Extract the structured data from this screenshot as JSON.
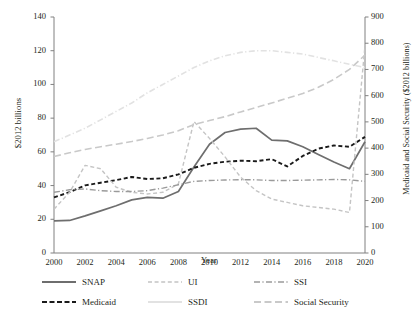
{
  "chart_data": {
    "type": "line",
    "title": "",
    "xlabel": "Year",
    "ylabel": "$2012 billions",
    "y2label": "Medicaid and Social Security ($2012 billions)",
    "xlim": [
      2000,
      2020
    ],
    "ylim": [
      0,
      140
    ],
    "y2lim": [
      0,
      900
    ],
    "grid": false,
    "legend_position": "bottom",
    "x": [
      2000,
      2001,
      2002,
      2003,
      2004,
      2005,
      2006,
      2007,
      2008,
      2009,
      2010,
      2011,
      2012,
      2013,
      2014,
      2015,
      2016,
      2017,
      2018,
      2019,
      2020
    ],
    "xticks": [
      "2000",
      "2002",
      "2004",
      "2006",
      "2008",
      "2010",
      "2012",
      "2014",
      "2016",
      "2018",
      "2020"
    ],
    "yticks": [
      "0",
      "20",
      "40",
      "60",
      "80",
      "100",
      "120",
      "140"
    ],
    "y2ticks": [
      "0",
      "100",
      "200",
      "300",
      "400",
      "500",
      "600",
      "700",
      "800",
      "900"
    ],
    "series": [
      {
        "name": "SNAP",
        "axis": "left",
        "color": "#6e6e6e",
        "style": "solid",
        "width": 1.7,
        "values": [
          19,
          19.3,
          22,
          25,
          28,
          31.5,
          33,
          32.5,
          36.5,
          51,
          64.5,
          71.5,
          73.5,
          74,
          67,
          66.5,
          63,
          58.5,
          54,
          50,
          66
        ]
      },
      {
        "name": "Medicaid",
        "axis": "right",
        "color": "#1a1a1a",
        "style": "dashed",
        "width": 1.9,
        "values": [
          212,
          232,
          258,
          268,
          278,
          290,
          282,
          285,
          300,
          325,
          340,
          348,
          352,
          350,
          358,
          330,
          370,
          398,
          410,
          405,
          443
        ]
      },
      {
        "name": "UI",
        "axis": "left",
        "color": "#c4c4c4",
        "style": "dashed",
        "width": 1.4,
        "values": [
          26,
          36,
          52,
          50,
          39,
          36,
          35,
          36,
          41,
          78,
          68,
          57,
          45,
          37,
          32,
          30,
          28,
          27,
          26,
          24,
          123
        ]
      },
      {
        "name": "SSDI",
        "axis": "left",
        "color": "#e2e2e2",
        "style": "dashdot",
        "width": 1.6,
        "values": [
          66,
          70,
          74,
          79,
          84,
          89,
          95,
          100,
          105,
          110,
          114,
          117,
          119,
          120,
          120,
          119,
          118,
          116,
          114,
          112,
          110
        ]
      },
      {
        "name": "SSI",
        "axis": "left",
        "color": "#9a9a9a",
        "style": "dashdot",
        "width": 1.4,
        "values": [
          36,
          37.5,
          38,
          37,
          36.5,
          36.5,
          37,
          38.5,
          40.5,
          42.5,
          43,
          43.3,
          43.5,
          43.4,
          43,
          43,
          43.2,
          43.4,
          43.6,
          43.4,
          42.5
        ]
      },
      {
        "name": "Social Security",
        "axis": "right",
        "color": "#c9c9c9",
        "style": "longdash",
        "width": 1.6,
        "values": [
          368,
          382,
          395,
          405,
          415,
          425,
          437,
          450,
          466,
          490,
          505,
          520,
          538,
          555,
          572,
          590,
          608,
          632,
          662,
          700,
          755
        ]
      }
    ],
    "legend": [
      {
        "label": "SNAP",
        "color": "#6e6e6e",
        "style": "solid",
        "width": 1.9
      },
      {
        "label": "UI",
        "color": "#c4c4c4",
        "style": "dashed",
        "width": 1.6
      },
      {
        "label": "SSI",
        "color": "#9a9a9a",
        "style": "dashdot",
        "width": 1.6
      },
      {
        "label": "Medicaid",
        "color": "#1a1a1a",
        "style": "dashed",
        "width": 2.2
      },
      {
        "label": "SSDI",
        "color": "#e2e2e2",
        "style": "solid",
        "width": 1.8
      },
      {
        "label": "Social Security",
        "color": "#c9c9c9",
        "style": "longdash",
        "width": 1.8
      }
    ]
  }
}
